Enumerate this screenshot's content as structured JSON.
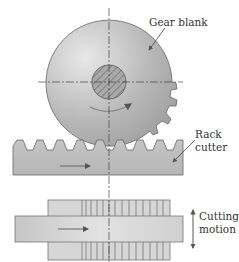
{
  "diagram": {
    "type": "gear-shaping-with-rack-cutter",
    "labels": {
      "gear_blank": "Gear blank",
      "rack_cutter_line1": "Rack",
      "rack_cutter_line2": "cutter",
      "cutting_motion_line1": "Cutting",
      "cutting_motion_line2": "motion"
    },
    "components": [
      {
        "id": "gear-blank",
        "shape": "partially-cut circular blank with teeth on lower right",
        "fill": "#b5b5b5"
      },
      {
        "id": "hub",
        "shape": "hatched circle at gear center",
        "fill": "#a8a8a8"
      },
      {
        "id": "rack-cutter",
        "shape": "rectangular bar with trapezoidal teeth on top",
        "fill": "#bdbdbd"
      },
      {
        "id": "side-view",
        "shape": "top view of rack cutter and blank",
        "fill": "#c8c8c8"
      }
    ],
    "arrows": [
      {
        "id": "rotation-arrow",
        "direction": "clockwise"
      },
      {
        "id": "rack-feed-arrow",
        "direction": "right"
      },
      {
        "id": "side-feed-arrow",
        "direction": "right"
      },
      {
        "id": "cutting-motion-arrow",
        "direction": "up-down"
      }
    ],
    "colors": {
      "stroke": "#555555",
      "fill_light": "#e6e6e6",
      "fill_mid": "#bcbcbc",
      "fill_dark": "#9c9c9c"
    }
  }
}
